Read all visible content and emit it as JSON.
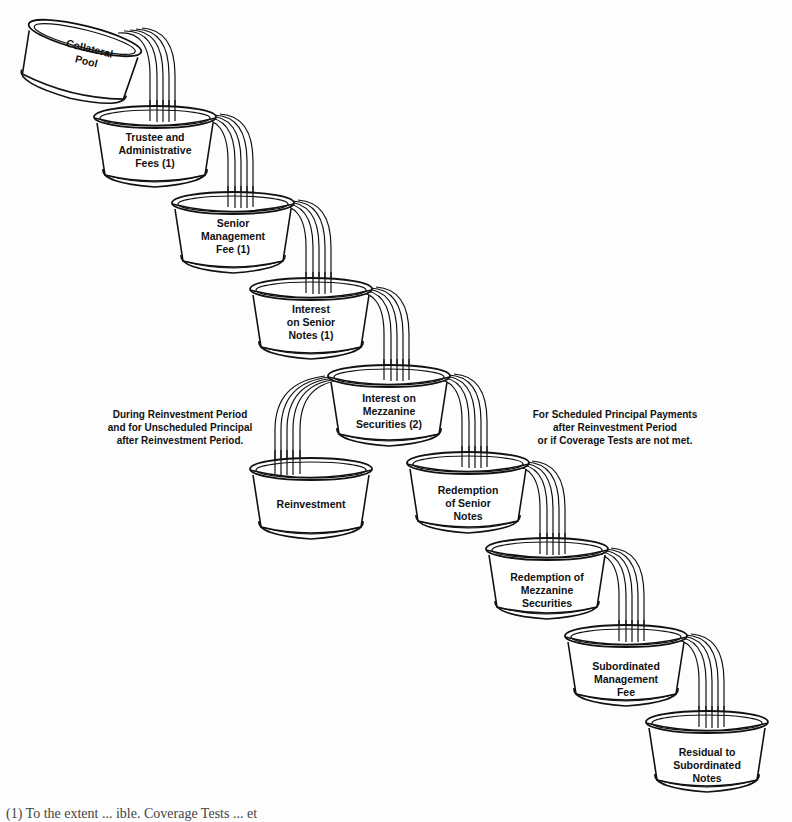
{
  "diagram": {
    "type": "cascading waterfall of cash flows (CDO payment priority)",
    "source_bowl": "Collateral Pool",
    "bowls": [
      {
        "id": "collateral-pool",
        "label": "Collateral\nPool"
      },
      {
        "id": "trustee-fees",
        "label": "Trustee and\nAdministrative\nFees (1)"
      },
      {
        "id": "senior-management-fee",
        "label": "Senior\nManagement\nFee (1)"
      },
      {
        "id": "interest-senior-notes",
        "label": "Interest\non Senior\nNotes (1)"
      },
      {
        "id": "interest-mezzanine",
        "label": "Interest on\nMezzanine\nSecurities (2)"
      },
      {
        "id": "reinvestment",
        "label": "Reinvestment"
      },
      {
        "id": "redemption-senior-notes",
        "label": "Redemption\nof Senior\nNotes"
      },
      {
        "id": "redemption-mezzanine",
        "label": "Redemption of\nMezzanine\nSecurities"
      },
      {
        "id": "subordinated-management-fee",
        "label": "Subordinated\nManagement\nFee"
      },
      {
        "id": "residual-subordinated-notes",
        "label": "Residual to\nSubordinated\nNotes"
      }
    ],
    "flows": [
      [
        "collateral-pool",
        "trustee-fees"
      ],
      [
        "trustee-fees",
        "senior-management-fee"
      ],
      [
        "senior-management-fee",
        "interest-senior-notes"
      ],
      [
        "interest-senior-notes",
        "interest-mezzanine"
      ],
      [
        "interest-mezzanine",
        "reinvestment"
      ],
      [
        "interest-mezzanine",
        "redemption-senior-notes"
      ],
      [
        "redemption-senior-notes",
        "redemption-mezzanine"
      ],
      [
        "redemption-mezzanine",
        "subordinated-management-fee"
      ],
      [
        "subordinated-management-fee",
        "residual-subordinated-notes"
      ]
    ],
    "notes": {
      "left": "During Reinvestment Period\nand for Unscheduled Principal\nafter Reinvestment Period.",
      "right": "For Scheduled Principal Payments\nafter Reinvestment Period\nor if Coverage Tests are not met."
    },
    "footnote_partial": "(1) To the extent ... ible. Coverage Tests ... et"
  }
}
